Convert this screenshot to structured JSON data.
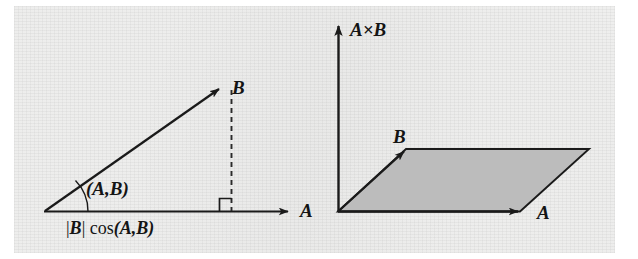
{
  "figure": {
    "background_color": "#f2f2f1",
    "ink_color": "#1a1a1a",
    "fill_color": "#bcbcbc"
  },
  "left_panel": {
    "name": "dot-product-projection-diagram",
    "axis_label_a": "A",
    "vector_label_b": "B",
    "angle_label": "(A,B)",
    "projection_label_prefix": "|",
    "projection_label_vector": "B",
    "projection_label_suffix": "| cos",
    "projection_label_angle": "(A,B)",
    "projection_label_full": "|B| cos(A,B)",
    "right_angle_marker": "right-angle",
    "dashed_line": "projection-dropline"
  },
  "right_panel": {
    "name": "cross-product-parallelogram-diagram",
    "axis_label_cross": "A×B",
    "axis_label_cross_left": "A",
    "axis_label_cross_times": "×",
    "axis_label_cross_right": "B",
    "vector_label_a": "A",
    "vector_label_b": "B",
    "parallelogram_fill": "#bcbcbc"
  }
}
